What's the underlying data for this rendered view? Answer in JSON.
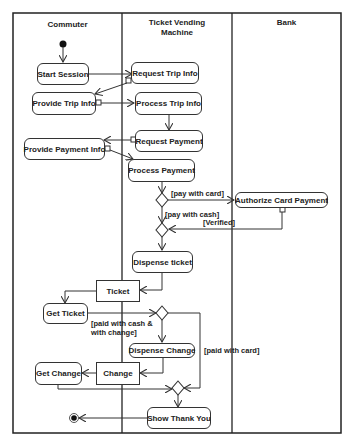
{
  "diagram": {
    "type": "uml-activity-diagram",
    "swimlanes": [
      {
        "id": "commuter",
        "title": "Commuter"
      },
      {
        "id": "tvm",
        "title": "Ticket Vending\nMachine"
      },
      {
        "id": "bank",
        "title": "Bank"
      }
    ],
    "actions": {
      "start_session": "Start Session",
      "request_trip_info": "Request Trip Info",
      "provide_trip_info": "Provide Trip Info",
      "process_trip_info": "Process Trip Info",
      "request_payment": "Request Payment",
      "provide_payment_info": "Provide Payment Info",
      "process_payment": "Process Payment",
      "authorize_card_payment": "Authorize Card Payment",
      "dispense_ticket": "Dispense ticket",
      "get_ticket": "Get Ticket",
      "dispense_change": "Dispense Change",
      "get_change": "Get Change",
      "show_thank_you": "Show Thank You"
    },
    "objects": {
      "ticket": "Ticket",
      "change": "Change"
    },
    "guards": {
      "pay_with_card": "[pay with card]",
      "pay_with_cash": "[pay with cash]",
      "verified": "[Verified]",
      "paid_with_cash_change_1": "[paid with cash &",
      "paid_with_cash_change_2": "with change]",
      "paid_with_card": "[paid with card]"
    }
  }
}
